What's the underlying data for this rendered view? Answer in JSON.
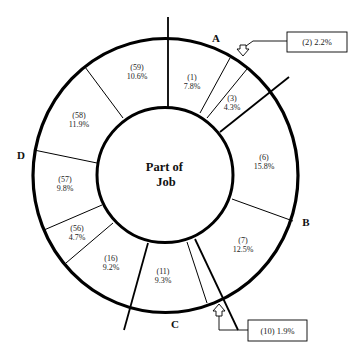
{
  "diagram": {
    "center_label": [
      "Part of",
      "Job"
    ],
    "points": [
      {
        "id": "A",
        "label": "A",
        "x": 216,
        "y": 42
      },
      {
        "id": "B",
        "label": "B",
        "x": 304,
        "y": 225
      },
      {
        "id": "C",
        "label": "C",
        "x": 175,
        "y": 327
      },
      {
        "id": "D",
        "label": "D",
        "x": 21,
        "y": 159
      }
    ],
    "segments": [
      {
        "id": "1",
        "number": "(1)",
        "percent": "7.8%",
        "x": 192,
        "y": 77
      },
      {
        "id": "2",
        "number": "(2)",
        "percent": "2.2%",
        "callout": "(2) 2.2%"
      },
      {
        "id": "3",
        "number": "(3)",
        "percent": "4.3%",
        "x": 231,
        "y": 101
      },
      {
        "id": "6",
        "number": "(6)",
        "percent": "15.8%",
        "x": 262,
        "y": 159
      },
      {
        "id": "7",
        "number": "(7)",
        "percent": "12.5%",
        "x": 242,
        "y": 244
      },
      {
        "id": "10",
        "number": "(10)",
        "percent": "1.9%",
        "callout": "(10) 1.9%"
      },
      {
        "id": "11",
        "number": "(11)",
        "percent": "9.3%",
        "x": 162,
        "y": 275
      },
      {
        "id": "16",
        "number": "(16)",
        "percent": "9.2%",
        "x": 110,
        "y": 261
      },
      {
        "id": "56",
        "number": "(56)",
        "percent": "4.7%",
        "x": 78,
        "y": 232
      },
      {
        "id": "57",
        "number": "(57)",
        "percent": "9.8%",
        "x": 65,
        "y": 182
      },
      {
        "id": "58",
        "number": "(58)",
        "percent": "11.9%",
        "x": 79,
        "y": 118
      },
      {
        "id": "59",
        "number": "(59)",
        "percent": "10.6%",
        "x": 137,
        "y": 69
      }
    ],
    "callouts": [
      {
        "id": "2",
        "text": "(2) 2.2%"
      },
      {
        "id": "10",
        "text": "(10) 1.9%"
      }
    ],
    "colors": {
      "stroke": "#000000",
      "background": "#ffffff",
      "text": "#222222"
    }
  }
}
